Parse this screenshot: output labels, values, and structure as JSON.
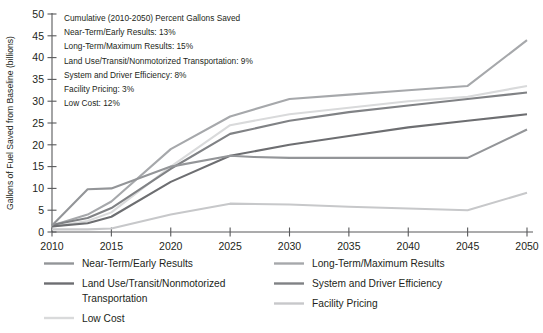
{
  "chart_data": {
    "type": "line",
    "title": "",
    "xlabel": "",
    "ylabel": "Gallons of Fuel Saved from Baseline (billions)",
    "x": [
      2010,
      2013,
      2015,
      2020,
      2025,
      2027,
      2030,
      2035,
      2040,
      2045,
      2050
    ],
    "xticks": [
      "2010",
      "2015",
      "2020",
      "2025",
      "2030",
      "2035",
      "2040",
      "2045",
      "2050"
    ],
    "xtick_values": [
      2010,
      2015,
      2020,
      2025,
      2030,
      2035,
      2040,
      2045,
      2050
    ],
    "yticks": [
      "0",
      "5",
      "10",
      "15",
      "20",
      "25",
      "30",
      "35",
      "40",
      "45",
      "50"
    ],
    "ytick_values": [
      0,
      5,
      10,
      15,
      20,
      25,
      30,
      35,
      40,
      45,
      50
    ],
    "xlim": [
      2010,
      2050
    ],
    "ylim": [
      0,
      50
    ],
    "grid": false,
    "legend_position": "bottom",
    "series": [
      {
        "name": "Long-Term/Maximum Results",
        "color": "#a6a8ab",
        "x": [
          2010,
          2013,
          2015,
          2020,
          2025,
          2030,
          2035,
          2040,
          2045,
          2050
        ],
        "values": [
          1.5,
          4.0,
          7.0,
          19.0,
          26.5,
          30.5,
          31.5,
          32.5,
          33.5,
          44.0
        ]
      },
      {
        "name": "Low Cost",
        "color": "#d9dadb",
        "x": [
          2010,
          2013,
          2015,
          2020,
          2025,
          2030,
          2035,
          2040,
          2045,
          2050
        ],
        "values": [
          1.2,
          2.5,
          4.5,
          15.0,
          24.5,
          27.0,
          28.5,
          30.0,
          31.0,
          33.5
        ]
      },
      {
        "name": "System and Driver Efficiency",
        "color": "#808285",
        "x": [
          2010,
          2013,
          2015,
          2020,
          2025,
          2030,
          2035,
          2040,
          2045,
          2050
        ],
        "values": [
          1.6,
          3.2,
          5.5,
          14.5,
          22.5,
          25.5,
          27.5,
          29.0,
          30.5,
          32.0
        ]
      },
      {
        "name": "Land Use/Transit/Nonmotorized Transportation",
        "color": "#6d6e71",
        "x": [
          2010,
          2013,
          2015,
          2020,
          2025,
          2030,
          2035,
          2040,
          2045,
          2050
        ],
        "values": [
          1.3,
          2.0,
          3.5,
          11.5,
          17.5,
          20.0,
          22.0,
          24.0,
          25.5,
          27.0
        ]
      },
      {
        "name": "Near-Term/Early Results",
        "color": "#939598",
        "x": [
          2010,
          2013,
          2015,
          2020,
          2025,
          2027,
          2030,
          2035,
          2040,
          2045,
          2050
        ],
        "values": [
          1.5,
          9.8,
          10.0,
          15.0,
          17.5,
          17.2,
          17.0,
          17.0,
          17.0,
          17.0,
          23.5
        ]
      },
      {
        "name": "Facility Pricing",
        "color": "#c7c8ca",
        "x": [
          2010,
          2013,
          2015,
          2020,
          2025,
          2030,
          2035,
          2040,
          2045,
          2050
        ],
        "values": [
          0.6,
          0.6,
          0.8,
          4.0,
          6.5,
          6.3,
          5.8,
          5.4,
          5.0,
          9.0
        ]
      }
    ],
    "annotations": [
      "Cumulative (2010-2050) Percent Gallons Saved",
      "Near-Term/Early Results:  13%",
      "Long-Term/Maximum Results:  15%",
      "Land Use/Transit/Nonmotorized Transportation:  9%",
      "System and Driver Efficiency:  8%",
      "Facility Pricing:  3%",
      "Low Cost:  12%"
    ]
  },
  "legend": {
    "column_left": [
      {
        "label": "Near-Term/Early Results",
        "color": "#939598",
        "line2": ""
      },
      {
        "label": "Land Use/Transit/Nonmotorized",
        "color": "#6d6e71",
        "line2": "Transportation"
      },
      {
        "label": "Low Cost",
        "color": "#d9dadb",
        "line2": ""
      }
    ],
    "column_right": [
      {
        "label": "Long-Term/Maximum Results",
        "color": "#a6a8ab",
        "line2": ""
      },
      {
        "label": "System and Driver Efficiency",
        "color": "#808285",
        "line2": ""
      },
      {
        "label": "Facility Pricing",
        "color": "#c7c8ca",
        "line2": ""
      }
    ]
  },
  "colors": {
    "axis": "#58595b",
    "text": "#231f20",
    "background": "#ffffff"
  }
}
